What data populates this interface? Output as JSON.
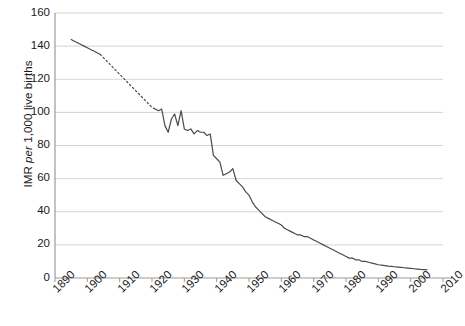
{
  "chart_data": {
    "type": "line",
    "title": "",
    "subtitle": "",
    "xlabel": "",
    "ylabel": "IMR per 1,000 live births",
    "ylabel_parts": {
      "pre": "IMR ",
      "italic": "per",
      "post": " 1,000 live births"
    },
    "xlim": [
      1890,
      2010
    ],
    "ylim": [
      0,
      160
    ],
    "grid": "horizontal",
    "legend": "none",
    "x_ticks": [
      1890,
      1900,
      1910,
      1920,
      1930,
      1940,
      1950,
      1960,
      1970,
      1980,
      1990,
      2000,
      2010
    ],
    "x_tick_labels": [
      "1890",
      "1900",
      "1910",
      "1920",
      "1930",
      "1940",
      "1950",
      "1960",
      "1970",
      "1980",
      "1990",
      "2000",
      "2010"
    ],
    "y_ticks": [
      0,
      20,
      40,
      60,
      80,
      100,
      120,
      140,
      160
    ],
    "y_tick_labels": [
      "0",
      "20",
      "40",
      "60",
      "80",
      "100",
      "120",
      "140",
      "160"
    ],
    "series": [
      {
        "name": "IMR observed (early)",
        "style": "solid",
        "color": "#4a4a4a",
        "x": [
          1895,
          1896,
          1897,
          1898,
          1899,
          1900,
          1901,
          1902,
          1903,
          1904
        ],
        "values": [
          144,
          143,
          142,
          141,
          140,
          139,
          138,
          137,
          136,
          135
        ]
      },
      {
        "name": "IMR interpolated",
        "style": "dotted",
        "color": "#4a4a4a",
        "x": [
          1904,
          1906,
          1908,
          1910,
          1912,
          1914,
          1916,
          1918,
          1920,
          1921
        ],
        "values": [
          135,
          131,
          127,
          123,
          119,
          115,
          111,
          107,
          103,
          102
        ]
      },
      {
        "name": "IMR observed",
        "style": "solid",
        "color": "#4a4a4a",
        "x": [
          1921,
          1922,
          1923,
          1924,
          1925,
          1926,
          1927,
          1928,
          1929,
          1930,
          1931,
          1932,
          1933,
          1934,
          1935,
          1936,
          1937,
          1938,
          1939,
          1940,
          1941,
          1942,
          1943,
          1944,
          1945,
          1946,
          1947,
          1948,
          1949,
          1950,
          1951,
          1952,
          1953,
          1954,
          1955,
          1956,
          1957,
          1958,
          1959,
          1960,
          1961,
          1962,
          1963,
          1964,
          1965,
          1966,
          1967,
          1968,
          1969,
          1970,
          1971,
          1972,
          1973,
          1974,
          1975,
          1976,
          1977,
          1978,
          1979,
          1980,
          1981,
          1982,
          1983,
          1984,
          1985,
          1986,
          1987,
          1988,
          1989,
          1990,
          1991,
          1992,
          1993,
          1994,
          1995,
          1996,
          1997,
          1998,
          1999,
          2000,
          2001,
          2002,
          2003,
          2004,
          2005
        ],
        "values": [
          102,
          101,
          102,
          92,
          88,
          96,
          99,
          92,
          101,
          90,
          89,
          90,
          87,
          89,
          88,
          88,
          86,
          87,
          74,
          72,
          70,
          62,
          63,
          64,
          66,
          59,
          57,
          55,
          52,
          50,
          46,
          43,
          41,
          39,
          37,
          36,
          35,
          34,
          33,
          32,
          30,
          29,
          28,
          27,
          26,
          26,
          25,
          25,
          24,
          23,
          22,
          21,
          20,
          19,
          18,
          17,
          16,
          15,
          14,
          13,
          12,
          12,
          11,
          11,
          10,
          10,
          9.5,
          9,
          8.5,
          8,
          7.8,
          7.5,
          7.2,
          7,
          6.8,
          6.6,
          6.4,
          6.2,
          6,
          5.8,
          5.6,
          5.4,
          5.2,
          5.1,
          5
        ]
      }
    ]
  },
  "axis": {
    "y_title": "IMR per 1,000 live births"
  }
}
